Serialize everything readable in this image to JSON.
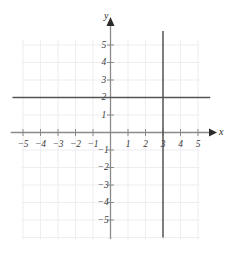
{
  "chart_data": {
    "type": "line",
    "title": "",
    "xlabel": "x",
    "ylabel": "y",
    "xlim": [
      -5.7,
      5.8
    ],
    "ylim": [
      -5.9,
      5.6
    ],
    "grid": true,
    "grid_step": 1,
    "legend": "none",
    "xticks": [
      -5,
      -4,
      -3,
      -2,
      -1,
      1,
      2,
      3,
      4,
      5
    ],
    "yticks": [
      5,
      4,
      3,
      2,
      1,
      -1,
      -2,
      -3,
      -4,
      -5
    ],
    "xtick_labels": [
      "−5",
      "−4",
      "−3",
      "−2",
      "−1",
      "1",
      "2",
      "3",
      "4",
      "5"
    ],
    "ytick_labels": [
      "5",
      "4",
      "3",
      "2",
      "1",
      "−1",
      "−2",
      "−3",
      "−4",
      "−5"
    ],
    "series": [
      {
        "name": "y = 2",
        "type": "horizontal-line",
        "value": 2,
        "x_start": -5.6,
        "x_end": 5.7,
        "color": "#555555"
      },
      {
        "name": "x = 3",
        "type": "vertical-line",
        "value": 3,
        "y_start": -6.0,
        "y_end": 5.8,
        "color": "#555555"
      }
    ],
    "intersection": {
      "x": 3,
      "y": 2
    },
    "axis_color": "#8a8a8a",
    "grid_color": "#ededf2",
    "line_color": "#555555",
    "label_color": "#3a3a3a",
    "background": "#ffffff"
  },
  "labels": {
    "x_axis_name": "x",
    "y_axis_name": "y"
  }
}
